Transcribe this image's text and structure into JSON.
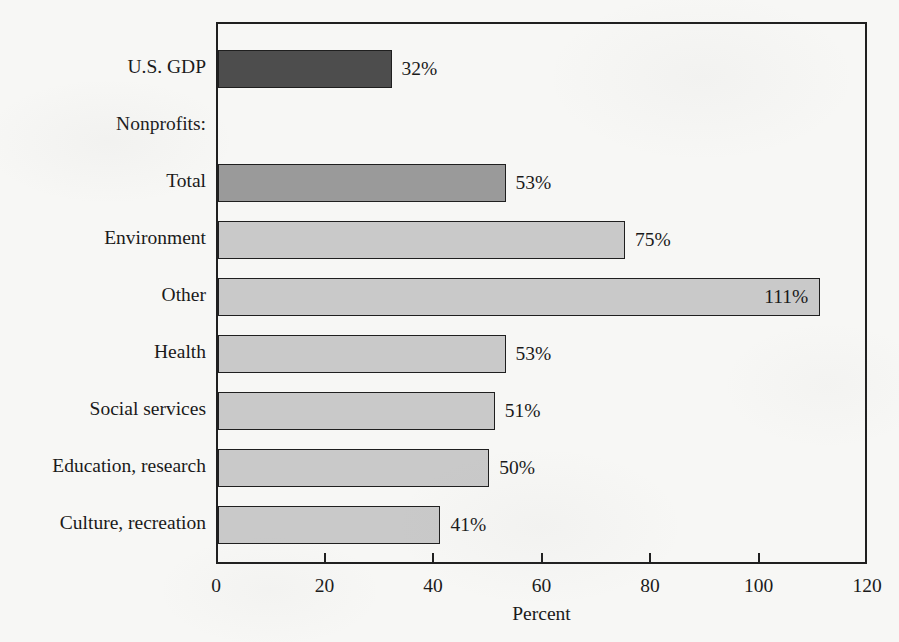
{
  "chart_data": {
    "type": "bar",
    "orientation": "horizontal",
    "title": "",
    "xlabel": "Percent",
    "ylabel": "",
    "xlim": [
      0,
      120
    ],
    "xticks": [
      0,
      20,
      40,
      60,
      80,
      100,
      120
    ],
    "xtick_labels": [
      "0",
      "20",
      "40",
      "60",
      "80",
      "100",
      "120"
    ],
    "grid": false,
    "legend": false,
    "value_suffix": "%",
    "categories": [
      "U.S. GDP",
      "Nonprofits:",
      "Total",
      "Environment",
      "Other",
      "Health",
      "Social services",
      "Education, research",
      "Culture, recreation"
    ],
    "values": [
      32,
      null,
      53,
      75,
      111,
      53,
      51,
      50,
      41
    ],
    "value_labels": [
      "32%",
      "",
      "53%",
      "75%",
      "111%",
      "53%",
      "51%",
      "50%",
      "41%"
    ],
    "rows": [
      {
        "label": "U.S. GDP",
        "value": 32,
        "value_label": "32%",
        "shade": "dark",
        "is_header": false,
        "label_inside": false
      },
      {
        "label": "Nonprofits:",
        "value": null,
        "value_label": "",
        "shade": "none",
        "is_header": true,
        "label_inside": false
      },
      {
        "label": "Total",
        "value": 53,
        "value_label": "53%",
        "shade": "medium",
        "is_header": false,
        "label_inside": false
      },
      {
        "label": "Environment",
        "value": 75,
        "value_label": "75%",
        "shade": "light",
        "is_header": false,
        "label_inside": false
      },
      {
        "label": "Other",
        "value": 111,
        "value_label": "111%",
        "shade": "light",
        "is_header": false,
        "label_inside": true
      },
      {
        "label": "Health",
        "value": 53,
        "value_label": "53%",
        "shade": "light",
        "is_header": false,
        "label_inside": false
      },
      {
        "label": "Social services",
        "value": 51,
        "value_label": "51%",
        "shade": "light",
        "is_header": false,
        "label_inside": false
      },
      {
        "label": "Education, research",
        "value": 50,
        "value_label": "50%",
        "shade": "light",
        "is_header": false,
        "label_inside": false
      },
      {
        "label": "Culture, recreation",
        "value": 41,
        "value_label": "41%",
        "shade": "light",
        "is_header": false,
        "label_inside": false
      }
    ],
    "colors": {
      "dark": "#4d4d4d",
      "medium": "#9a9a9a",
      "light": "#c9c9c9",
      "outline": "#1f1f1f",
      "background": "#f7f7f5"
    }
  }
}
